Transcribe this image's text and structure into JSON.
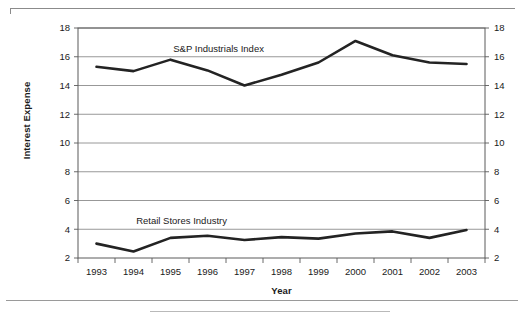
{
  "figure": {
    "ylabel": "Interest Expense",
    "xlabel": "Year"
  },
  "chart_data": {
    "type": "line",
    "title": "",
    "xlabel": "Year",
    "ylabel": "Interest Expense",
    "categories": [
      "1993",
      "1994",
      "1995",
      "1996",
      "1997",
      "1998",
      "1999",
      "2000",
      "2001",
      "2002",
      "2003"
    ],
    "x": [
      1993,
      1994,
      1995,
      1996,
      1997,
      1998,
      1999,
      2000,
      2001,
      2002,
      2003
    ],
    "ylim": [
      2,
      18
    ],
    "yticks": [
      2,
      4,
      6,
      8,
      10,
      12,
      14,
      16,
      18
    ],
    "ytick_labels_left": [
      "2",
      "4",
      "6",
      "8",
      "10",
      "12",
      "14",
      "16",
      "18"
    ],
    "ytick_labels_right": [
      "2",
      "4",
      "6",
      "8",
      "10",
      "12",
      "14",
      "16",
      "18"
    ],
    "grid": true,
    "legend": "inline-annotations",
    "series": [
      {
        "name": "S&P Industrials Index",
        "label_x": 1996.3,
        "label_y": 16.35,
        "values": [
          15.3,
          15.0,
          15.8,
          15.05,
          14.0,
          14.75,
          15.6,
          17.1,
          16.1,
          15.6,
          15.5
        ]
      },
      {
        "name": "Retail Stores Industry",
        "label_x": 1995.3,
        "label_y": 4.35,
        "values": [
          3.0,
          2.45,
          3.4,
          3.55,
          3.25,
          3.45,
          3.35,
          3.7,
          3.85,
          3.4,
          3.95
        ]
      }
    ]
  }
}
